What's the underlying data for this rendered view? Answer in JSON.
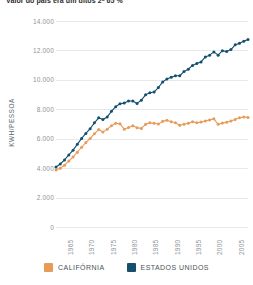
{
  "chart_data": {
    "type": "line",
    "title": "Valor do pais era um ditos 2ª 65 %",
    "xlabel": "",
    "ylabel": "KWH/PESSOA",
    "ylim": [
      0,
      14000
    ],
    "xlim": [
      1963,
      2008
    ],
    "grid": true,
    "legend_position": "bottom",
    "y_ticks": [
      "0",
      "2.000",
      "4.000",
      "6.000",
      "8.000",
      "10.000",
      "12.000",
      "14.000"
    ],
    "y_tick_values": [
      0,
      2000,
      4000,
      6000,
      8000,
      10000,
      12000,
      14000
    ],
    "x_ticks": [
      "1965",
      "1970",
      "1975",
      "1980",
      "1985",
      "1990",
      "1995",
      "2000",
      "2005"
    ],
    "x_tick_values": [
      1965,
      1970,
      1975,
      1980,
      1985,
      1990,
      1995,
      2000,
      2005
    ],
    "x": [
      1963,
      1964,
      1965,
      1966,
      1967,
      1968,
      1969,
      1970,
      1971,
      1972,
      1973,
      1974,
      1975,
      1976,
      1977,
      1978,
      1979,
      1980,
      1981,
      1982,
      1983,
      1984,
      1985,
      1986,
      1987,
      1988,
      1989,
      1990,
      1991,
      1992,
      1993,
      1994,
      1995,
      1996,
      1997,
      1998,
      1999,
      2000,
      2001,
      2002,
      2003,
      2004,
      2005,
      2006,
      2007,
      2008
    ],
    "series": [
      {
        "name": "CALIFÓRNIA",
        "color": "#e89a57",
        "values": [
          3870,
          4000,
          4200,
          4480,
          4760,
          5080,
          5420,
          5740,
          6020,
          6330,
          6620,
          6450,
          6650,
          6880,
          7050,
          7010,
          6650,
          6760,
          6880,
          6750,
          6700,
          6980,
          7080,
          7050,
          7000,
          7180,
          7250,
          7150,
          7080,
          6920,
          6980,
          7050,
          7160,
          7080,
          7130,
          7200,
          7280,
          7350,
          6980,
          7060,
          7120,
          7200,
          7300,
          7420,
          7480,
          7450
        ]
      },
      {
        "name": "ESTADOS UNIDOS",
        "color": "#14506e",
        "values": [
          4080,
          4280,
          4560,
          4900,
          5220,
          5620,
          6020,
          6360,
          6680,
          7080,
          7420,
          7300,
          7480,
          7860,
          8180,
          8380,
          8420,
          8560,
          8560,
          8400,
          8620,
          8980,
          9120,
          9180,
          9480,
          9860,
          10060,
          10180,
          10280,
          10280,
          10560,
          10720,
          10980,
          11120,
          11220,
          11560,
          11680,
          11900,
          11680,
          11980,
          11920,
          12060,
          12380,
          12480,
          12620,
          12740
        ]
      }
    ]
  },
  "legend": {
    "items": [
      {
        "label": "CALIFÓRNIA",
        "color": "#e89a57"
      },
      {
        "label": "ESTADOS UNIDOS",
        "color": "#14506e"
      }
    ]
  }
}
